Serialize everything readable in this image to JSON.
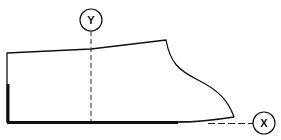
{
  "diagram": {
    "type": "technical-outline",
    "stroke_color": "#111111",
    "background": "#ffffff",
    "markers": [
      {
        "id": "Y",
        "label": "Y",
        "cx": 91,
        "cy": 20,
        "r": 11,
        "guide": "vertical dashed line from marker down to bottom edge at x=91"
      },
      {
        "id": "X",
        "label": "X",
        "cx": 264,
        "cy": 123,
        "r": 11,
        "guide": "horizontal dashed line from curve toe end to marker at y=123"
      }
    ],
    "outline": {
      "top_left": [
        7,
        53
      ],
      "top_right_corner": [
        166,
        40
      ],
      "toe_end": [
        234,
        117
      ],
      "bottom_left": [
        7,
        122
      ],
      "bottom_y": 122
    },
    "thick_segments": [
      {
        "name": "heel-back-edge",
        "from": [
          7,
          84
        ],
        "to": [
          7,
          122
        ]
      },
      {
        "name": "sole-bottom-edge",
        "from": [
          7,
          122
        ],
        "to": [
          178,
          122
        ]
      }
    ],
    "caption": ""
  }
}
